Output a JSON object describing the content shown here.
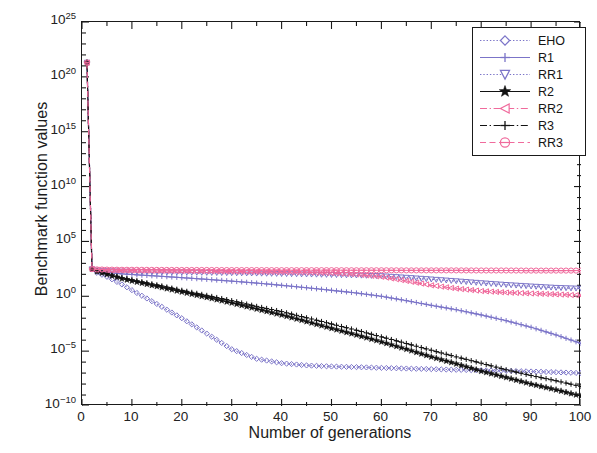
{
  "chart_data": {
    "type": "line",
    "title": "",
    "xlabel": "Number of generations",
    "ylabel": "Benchmark function values",
    "xlim": [
      0,
      100
    ],
    "ylim": [
      1e-10,
      1e+25
    ],
    "yscale": "log",
    "xticks": [
      0,
      10,
      20,
      30,
      40,
      50,
      60,
      70,
      80,
      90,
      100
    ],
    "xtick_labels": [
      "0",
      "10",
      "20",
      "30",
      "40",
      "50",
      "60",
      "70",
      "80",
      "90",
      "100"
    ],
    "ytick_exponents": [
      25,
      20,
      15,
      10,
      5,
      0,
      -5,
      -10
    ],
    "ytick_labels": [
      "10^25",
      "10^20",
      "10^15",
      "10^10",
      "10^5",
      "10^0",
      "10^-5",
      "10^-10"
    ],
    "grid": false,
    "legend_position": "top-right",
    "x": [
      1,
      2,
      3,
      5,
      8,
      11,
      15,
      20,
      25,
      30,
      35,
      40,
      45,
      50,
      55,
      60,
      65,
      70,
      75,
      80,
      85,
      90,
      95,
      100
    ],
    "series": [
      {
        "name": "EHO",
        "color": "#7b74c8",
        "marker": "diamond",
        "linestyle": "dotted",
        "values": [
          2e+21,
          300.0,
          140.0,
          60.0,
          12.0,
          2.0,
          0.2,
          0.01,
          0.0004,
          1.5e-05,
          2e-06,
          8e-07,
          5e-07,
          4e-07,
          3.5e-07,
          3e-07,
          2.6e-07,
          2.3e-07,
          2e-07,
          1.8e-07,
          1.6e-07,
          1.4e-07,
          1.2e-07,
          1e-07
        ]
      },
      {
        "name": "R1",
        "color": "#7b74c8",
        "marker": "plus",
        "linestyle": "solid",
        "values": [
          2e+21,
          300.0,
          200.0,
          150.0,
          110.0,
          90.0,
          70.0,
          50.0,
          35.0,
          24.0,
          16.0,
          10.0,
          6.0,
          3.5,
          2.0,
          1.0,
          0.4,
          0.15,
          0.06,
          0.02,
          0.006,
          0.0015,
          0.0003,
          5e-05
        ]
      },
      {
        "name": "RR1",
        "color": "#7b74c8",
        "marker": "triangle-down",
        "linestyle": "dotted",
        "values": [
          2e+21,
          300.0,
          230.0,
          200.0,
          180.0,
          170.0,
          160.0,
          150.0,
          140.0,
          130.0,
          120.0,
          110.0,
          100.0,
          90.0,
          80.0,
          70.0,
          50.0,
          35.0,
          24.0,
          16.0,
          11.0,
          8.0,
          6.0,
          5.0
        ]
      },
      {
        "name": "R2",
        "color": "#121212",
        "marker": "star",
        "linestyle": "solid",
        "values": [
          2e+21,
          300.0,
          180.0,
          100.0,
          40.0,
          20.0,
          8.0,
          2.5,
          0.8,
          0.25,
          0.07,
          0.02,
          0.005,
          0.0012,
          0.0003,
          7e-05,
          1.5e-05,
          3e-06,
          7e-07,
          1.5e-07,
          4e-08,
          1e-08,
          3e-09,
          8e-10
        ]
      },
      {
        "name": "RR2",
        "color": "#f06a9c",
        "marker": "triangle-left",
        "linestyle": "dashdot",
        "values": [
          2e+21,
          300.0,
          260.0,
          240.0,
          230.0,
          220.0,
          210.0,
          200.0,
          190.0,
          180.0,
          170.0,
          160.0,
          150.0,
          130.0,
          100.0,
          60.0,
          25.0,
          10.0,
          5.0,
          3.0,
          2.2,
          1.8,
          1.5,
          1.2
        ]
      },
      {
        "name": "R3",
        "color": "#121212",
        "marker": "plus",
        "linestyle": "dashdot",
        "values": [
          2e+21,
          300.0,
          190.0,
          120.0,
          50.0,
          26.0,
          11.0,
          3.5,
          1.2,
          0.4,
          0.12,
          0.04,
          0.011,
          0.003,
          0.0008,
          0.0002,
          5e-05,
          1.2e-05,
          3e-06,
          8e-07,
          2e-07,
          6e-08,
          2e-08,
          6e-09
        ]
      },
      {
        "name": "RR3",
        "color": "#f06a9c",
        "marker": "circle-dash",
        "linestyle": "dashed",
        "values": [
          2e+21,
          300.0,
          280.0,
          270.0,
          260.0,
          260.0,
          255.0,
          250.0,
          250.0,
          245.0,
          245.0,
          240.0,
          240.0,
          240.0,
          235.0,
          235.0,
          230.0,
          230.0,
          230.0,
          225.0,
          225.0,
          220.0,
          220.0,
          220.0
        ]
      }
    ]
  },
  "legend": {
    "items": [
      {
        "label": "EHO"
      },
      {
        "label": "R1"
      },
      {
        "label": "RR1"
      },
      {
        "label": "R2"
      },
      {
        "label": "RR2"
      },
      {
        "label": "R3"
      },
      {
        "label": "RR3"
      }
    ]
  },
  "colors": {
    "blue_purple": "#7b74c8",
    "pink": "#f06a9c",
    "black": "#121212",
    "axis": "#1a1a1a",
    "background": "#ffffff"
  }
}
